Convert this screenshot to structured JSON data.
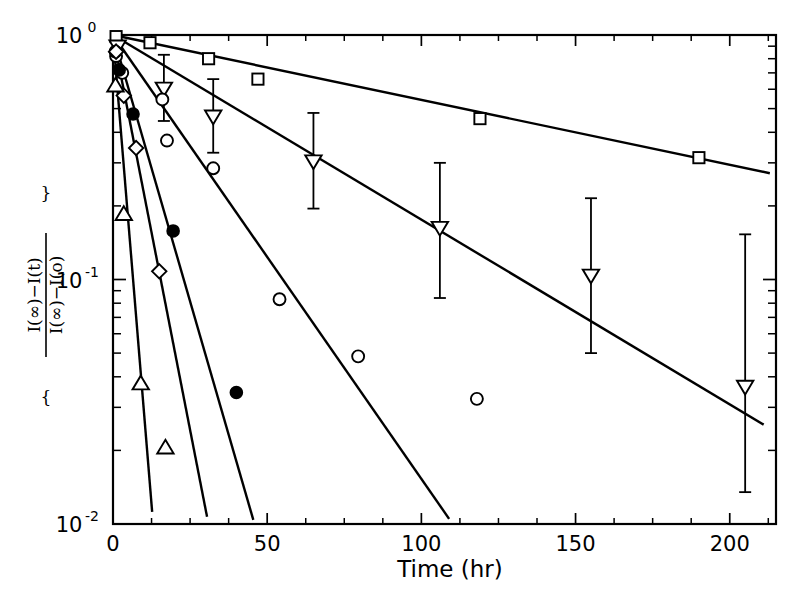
{
  "chart_data": {
    "type": "scatter",
    "title": "",
    "xlabel": "Time (hr)",
    "ylabel": "{ [I(∞) − I(t)] / [I(∞) − I(0)] }",
    "ylabel_parts": {
      "numerator": "I(∞)−I(t)",
      "denominator": "I(∞)−I(o)",
      "brace_open": "{",
      "brace_close": "}"
    },
    "xlim": [
      0,
      215
    ],
    "ylim": [
      0.01,
      1.0
    ],
    "yscale": "log",
    "xscale": "linear",
    "grid": false,
    "legend": "none",
    "xticks": [
      0,
      50,
      100,
      150,
      200
    ],
    "xticklabels": [
      "0",
      "50",
      "100",
      "150",
      "200"
    ],
    "yticks": [
      1,
      0.1,
      0.01
    ],
    "yticklabels": [
      "10⁰",
      "10⁻¹",
      "10⁻²"
    ],
    "ytick_mantissa": [
      "10",
      "10",
      "10"
    ],
    "ytick_exponent": [
      "0",
      "-1",
      "-2"
    ],
    "yminor_ticks": [
      0.9,
      0.8,
      0.7,
      0.6,
      0.5,
      0.4,
      0.3,
      0.2,
      0.09,
      0.08,
      0.07,
      0.06,
      0.05,
      0.04,
      0.03,
      0.02
    ],
    "series": [
      {
        "name": "open-square",
        "marker": "square-open",
        "has_error_bars": false,
        "points": [
          {
            "x": 1.0,
            "y": 0.985
          },
          {
            "x": 12.0,
            "y": 0.93
          },
          {
            "x": 31.0,
            "y": 0.8
          },
          {
            "x": 47.0,
            "y": 0.66
          },
          {
            "x": 119.0,
            "y": 0.455
          },
          {
            "x": 190.0,
            "y": 0.315
          }
        ],
        "fit_line": [
          {
            "x": 0.0,
            "y": 1.0
          },
          {
            "x": 213.0,
            "y": 0.272
          }
        ]
      },
      {
        "name": "open-down-triangle",
        "marker": "triangle-down-open",
        "has_error_bars": true,
        "points": [
          {
            "x": 1.5,
            "y": 0.9
          },
          {
            "x": 16.5,
            "y": 0.605,
            "err_low": 0.445,
            "err_high": 0.83
          },
          {
            "x": 32.5,
            "y": 0.465,
            "err_low": 0.33,
            "err_high": 0.66
          },
          {
            "x": 65.0,
            "y": 0.305,
            "err_low": 0.195,
            "err_high": 0.48
          },
          {
            "x": 106.0,
            "y": 0.163,
            "err_low": 0.084,
            "err_high": 0.3
          },
          {
            "x": 155.0,
            "y": 0.104,
            "err_low": 0.05,
            "err_high": 0.215
          },
          {
            "x": 205.0,
            "y": 0.0365,
            "err_low": 0.0135,
            "err_high": 0.153
          }
        ],
        "fit_line": [
          {
            "x": 0.0,
            "y": 1.0
          },
          {
            "x": 211.0,
            "y": 0.0255
          }
        ]
      },
      {
        "name": "open-circle",
        "marker": "circle-open",
        "has_error_bars": false,
        "points": [
          {
            "x": 1.0,
            "y": 0.82
          },
          {
            "x": 3.0,
            "y": 0.7
          },
          {
            "x": 16.0,
            "y": 0.545
          },
          {
            "x": 17.5,
            "y": 0.37
          },
          {
            "x": 32.5,
            "y": 0.285
          },
          {
            "x": 54.0,
            "y": 0.083
          },
          {
            "x": 79.5,
            "y": 0.0485
          },
          {
            "x": 118.0,
            "y": 0.0325
          }
        ],
        "fit_line": [
          {
            "x": 0.0,
            "y": 1.0
          },
          {
            "x": 109.0,
            "y": 0.0105
          }
        ]
      },
      {
        "name": "filled-circle",
        "marker": "circle-filled",
        "has_error_bars": false,
        "points": [
          {
            "x": 0.8,
            "y": 0.855
          },
          {
            "x": 2.0,
            "y": 0.72
          },
          {
            "x": 6.5,
            "y": 0.475
          },
          {
            "x": 19.5,
            "y": 0.158
          },
          {
            "x": 40.0,
            "y": 0.0345
          }
        ],
        "fit_line": [
          {
            "x": 0.0,
            "y": 1.0
          },
          {
            "x": 45.5,
            "y": 0.0104
          }
        ]
      },
      {
        "name": "open-diamond",
        "marker": "diamond-open",
        "has_error_bars": false,
        "points": [
          {
            "x": 1.0,
            "y": 0.855
          },
          {
            "x": 3.5,
            "y": 0.565
          },
          {
            "x": 7.5,
            "y": 0.345
          },
          {
            "x": 15.0,
            "y": 0.108
          }
        ],
        "fit_line": [
          {
            "x": 0.0,
            "y": 1.0
          },
          {
            "x": 30.5,
            "y": 0.0107
          }
        ]
      },
      {
        "name": "open-up-triangle",
        "marker": "triangle-up-open",
        "has_error_bars": false,
        "points": [
          {
            "x": 0.8,
            "y": 0.62
          },
          {
            "x": 3.5,
            "y": 0.185
          },
          {
            "x": 9.0,
            "y": 0.0375
          },
          {
            "x": 17.0,
            "y": 0.0205
          }
        ],
        "fit_line": [
          {
            "x": 0.0,
            "y": 1.0
          },
          {
            "x": 12.7,
            "y": 0.0112
          }
        ]
      }
    ]
  },
  "axes": {
    "x_title": "Time (hr)"
  },
  "colors": {
    "foreground": "#000000",
    "background": "#ffffff"
  }
}
